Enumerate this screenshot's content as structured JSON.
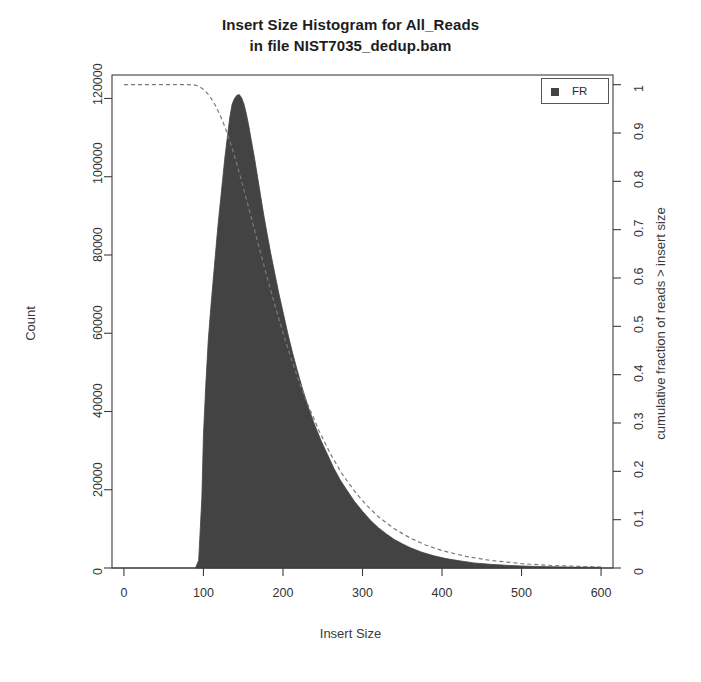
{
  "chart_data": {
    "type": "area",
    "title": "Insert Size Histogram for All_Reads",
    "subtitle": "in file NIST7035_dedup.bam",
    "title_lines": [
      "Insert Size Histogram for All_Reads",
      "in file NIST7035_dedup.bam"
    ],
    "xlabel": "Insert Size",
    "ylabel": "Count",
    "y2label": "cumulative fraction of reads > insert size",
    "xlim": [
      -15,
      615
    ],
    "ylim": [
      0,
      126000
    ],
    "y2lim": [
      0,
      1.02
    ],
    "grid": false,
    "legend_position": "top-right",
    "legend": [
      {
        "label": "FR",
        "color": "#434343",
        "marker": "filled-square"
      }
    ],
    "xticks": [
      0,
      100,
      200,
      300,
      400,
      500,
      600
    ],
    "xtick_labels": [
      "0",
      "100",
      "200",
      "300",
      "400",
      "500",
      "600"
    ],
    "yticks": [
      0,
      20000,
      40000,
      60000,
      80000,
      100000,
      120000
    ],
    "ytick_labels": [
      "0",
      "20000",
      "40000",
      "60000",
      "80000",
      "100000",
      "120000"
    ],
    "y2ticks": [
      0,
      0.1,
      0.2,
      0.3,
      0.4,
      0.5,
      0.6,
      0.7,
      0.8,
      0.9,
      1
    ],
    "y2tick_labels": [
      "0",
      "0.1",
      "0.2",
      "0.3",
      "0.4",
      "0.5",
      "0.6",
      "0.7",
      "0.8",
      "0.9",
      "1"
    ],
    "series": [
      {
        "name": "FR",
        "kind": "histogram",
        "color": "#434343",
        "x": [
          90,
          94,
          98,
          100,
          103,
          106,
          109,
          112,
          115,
          118,
          121,
          124,
          127,
          130,
          133,
          136,
          139,
          142,
          145,
          148,
          151,
          154,
          157,
          160,
          164,
          168,
          172,
          176,
          180,
          185,
          190,
          195,
          200,
          206,
          212,
          218,
          225,
          232,
          240,
          248,
          256,
          264,
          272,
          280,
          290,
          300,
          310,
          320,
          330,
          340,
          350,
          360,
          375,
          390,
          405,
          420,
          440,
          460,
          480,
          500,
          520,
          540,
          560,
          580,
          600
        ],
        "values": [
          0,
          2000,
          18000,
          34000,
          47000,
          58000,
          66000,
          73000,
          80000,
          87000,
          93000,
          99000,
          105000,
          110000,
          115000,
          118500,
          120000,
          120800,
          121000,
          120200,
          118500,
          116000,
          113000,
          109500,
          105000,
          100000,
          95000,
          90000,
          85500,
          80000,
          75000,
          70000,
          65500,
          60000,
          55000,
          50500,
          45500,
          41000,
          36500,
          32500,
          29000,
          25500,
          22500,
          20000,
          17000,
          14500,
          12200,
          10300,
          8700,
          7300,
          6200,
          5200,
          4000,
          3100,
          2400,
          1900,
          1300,
          950,
          700,
          520,
          390,
          300,
          230,
          180,
          140
        ]
      },
      {
        "name": "cumulative",
        "kind": "line",
        "style": "dashed",
        "color": "#7a7a7a",
        "x": [
          0,
          20,
          40,
          60,
          80,
          90,
          95,
          100,
          105,
          110,
          115,
          120,
          125,
          130,
          135,
          140,
          145,
          150,
          155,
          160,
          170,
          180,
          190,
          200,
          210,
          220,
          230,
          245,
          260,
          275,
          290,
          305,
          320,
          340,
          360,
          380,
          400,
          430,
          460,
          500,
          540,
          580,
          600
        ],
        "values": [
          1.0,
          1.0,
          1.0,
          1.0,
          1.0,
          0.999,
          0.996,
          0.99,
          0.982,
          0.971,
          0.957,
          0.94,
          0.921,
          0.899,
          0.874,
          0.847,
          0.818,
          0.788,
          0.757,
          0.726,
          0.663,
          0.602,
          0.543,
          0.487,
          0.435,
          0.387,
          0.343,
          0.285,
          0.235,
          0.193,
          0.159,
          0.13,
          0.106,
          0.081,
          0.062,
          0.047,
          0.036,
          0.024,
          0.016,
          0.009,
          0.005,
          0.003,
          0.002
        ]
      }
    ]
  },
  "plot_area": {
    "left": 112,
    "top": 75,
    "right": 613,
    "bottom": 568
  },
  "legend_panel": {
    "label": "FR"
  }
}
